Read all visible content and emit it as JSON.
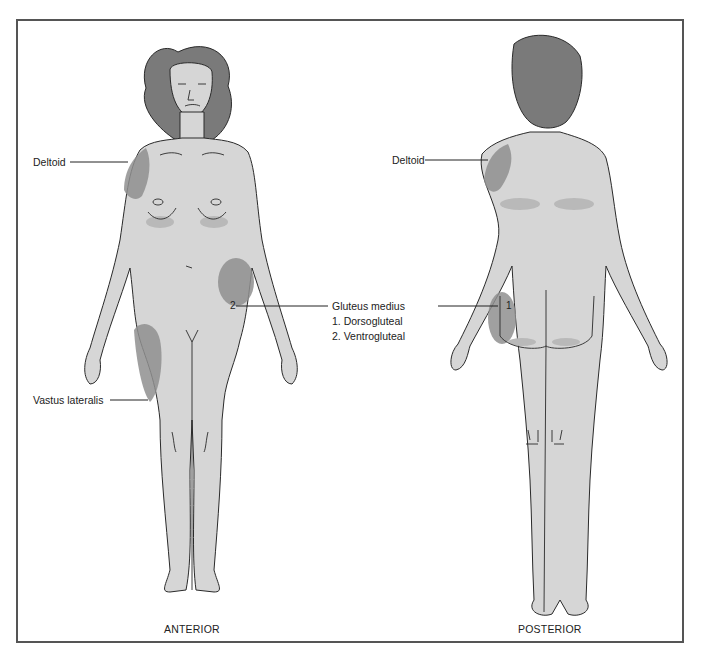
{
  "figure": {
    "views": [
      {
        "id": "anterior",
        "caption": "ANTERIOR"
      },
      {
        "id": "posterior",
        "caption": "POSTERIOR"
      }
    ],
    "labels": {
      "anterior_deltoid": "Deltoid",
      "vastus_lateralis": "Vastus lateralis",
      "posterior_deltoid": "Deltoid",
      "gluteus_medius": "Gluteus medius",
      "gluteus_item_1": "1. Dorsogluteal",
      "gluteus_item_2": "2. Ventrogluteal",
      "marker_ventrogluteal": "2",
      "marker_dorsogluteal": "1"
    },
    "colors": {
      "frame": "#555555",
      "skin": "#d6d6d6",
      "hair": "#7a7a7a",
      "injection_site": "#8f8f8f",
      "outline": "#2a2a2a"
    }
  }
}
